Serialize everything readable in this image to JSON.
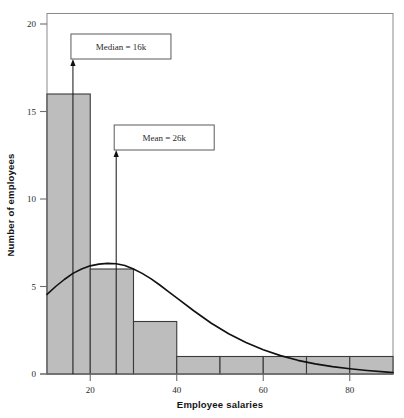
{
  "chart_data": {
    "type": "bar",
    "title": "",
    "subtitle": "",
    "xlabel": "Employee salaries",
    "ylabel": "Number of employees",
    "xlim": [
      10,
      90
    ],
    "ylim": [
      0,
      20.6
    ],
    "grid": false,
    "legend": "none",
    "bin_width": 10,
    "categories": [
      "10-20",
      "20-30",
      "30-40",
      "40-50",
      "50-60",
      "60-70",
      "70-80",
      "80-90"
    ],
    "bin_edges": [
      10,
      20,
      30,
      40,
      50,
      60,
      70,
      80,
      90
    ],
    "values": [
      16,
      6,
      3,
      1,
      1,
      1,
      1,
      1
    ],
    "xticks": [
      20,
      40,
      60,
      80
    ],
    "xtick_labels": [
      "20",
      "40",
      "60",
      "80"
    ],
    "yticks": [
      0,
      5,
      10,
      15,
      20
    ],
    "ytick_labels": [
      "0",
      "5",
      "10",
      "15",
      "20"
    ],
    "bar_fill_color": "#bdbdbd",
    "bar_edge_color": "#3a3a3a",
    "curve_color": "#111111",
    "axis_color": "#6e6e6e",
    "series": [
      {
        "name": "Density curve",
        "type": "line",
        "x": [
          10,
          12,
          14,
          16,
          18,
          20,
          22,
          24,
          26,
          28,
          30,
          32,
          34,
          36,
          38,
          40,
          44,
          48,
          52,
          56,
          60,
          64,
          68,
          72,
          76,
          80,
          84,
          88,
          90
        ],
        "y": [
          4.55,
          5.0,
          5.4,
          5.75,
          6.0,
          6.18,
          6.28,
          6.32,
          6.3,
          6.2,
          6.0,
          5.75,
          5.45,
          5.1,
          4.72,
          4.35,
          3.6,
          2.9,
          2.3,
          1.8,
          1.38,
          1.05,
          0.78,
          0.58,
          0.42,
          0.3,
          0.2,
          0.12,
          0.08
        ],
        "peak_x": 24,
        "peak_y": 6.32
      }
    ],
    "annotations": [
      {
        "name": "median-annotation",
        "label": "Median = 16k",
        "value": 16,
        "unit": "k",
        "arrow_x": 16,
        "arrow_tip_y": 18.0,
        "arrow_base_y": 0
      },
      {
        "name": "mean-annotation",
        "label": "Mean = 26k",
        "value": 26,
        "unit": "k",
        "arrow_x": 26,
        "arrow_tip_y": 12.8,
        "arrow_base_y": 0
      }
    ]
  },
  "axes": {
    "x_title": "Employee salaries",
    "y_title": "Number of employees"
  }
}
